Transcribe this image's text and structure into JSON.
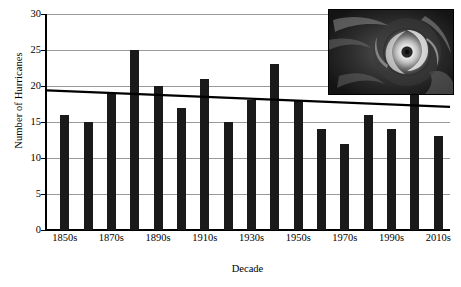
{
  "chart_data": {
    "type": "bar",
    "title": "",
    "xlabel": "Decade",
    "ylabel": "Number of Hurricanes",
    "categories": [
      "1850s",
      "1860s",
      "1870s",
      "1880s",
      "1890s",
      "1900s",
      "1910s",
      "1920s",
      "1930s",
      "1940s",
      "1950s",
      "1960s",
      "1970s",
      "1980s",
      "1990s",
      "2000s",
      "2010s"
    ],
    "values": [
      16,
      15,
      19,
      25,
      20,
      17,
      21,
      15,
      18,
      23,
      18,
      14,
      12,
      16,
      14,
      19,
      13
    ],
    "ylim": [
      0,
      30
    ],
    "yticks": [
      0,
      5,
      10,
      15,
      20,
      25,
      30
    ],
    "ytick_labels": [
      "0",
      "5",
      "10",
      "15",
      "20",
      "25",
      "30"
    ],
    "visible_xtick_labels": [
      "1850s",
      "1870s",
      "1890s",
      "1910s",
      "1930s",
      "1950s",
      "1970s",
      "1990s",
      "2010s"
    ],
    "visible_xtick_indices": [
      0,
      2,
      4,
      6,
      8,
      10,
      12,
      14,
      16
    ],
    "grid": true,
    "legend": "none",
    "series": [
      {
        "name": "Number of Hurricanes",
        "type": "bar",
        "values": [
          16,
          15,
          19,
          25,
          20,
          17,
          21,
          15,
          18,
          23,
          18,
          14,
          12,
          16,
          14,
          19,
          13
        ],
        "color": "#1a1a1a"
      },
      {
        "name": "Linear trend",
        "type": "line",
        "start_value": 19.4,
        "end_value": 17.1,
        "color": "#000000"
      }
    ],
    "annotations": [
      {
        "name": "hurricane-satellite-inset",
        "description": "grayscale satellite image of a hurricane with visible eye and spiral rain bands"
      }
    ]
  },
  "colors": {
    "bar": "#1a1a1a",
    "grid": "#9a9a9a",
    "axis": "#000000",
    "trend": "#000000"
  }
}
